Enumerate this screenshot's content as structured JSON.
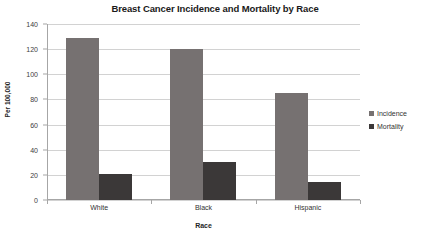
{
  "chart_data": {
    "type": "bar",
    "title": "Breast Cancer Incidence and Mortality by Race",
    "xlabel": "Race",
    "ylabel": "Per 100,000",
    "categories": [
      "White",
      "Black",
      "Hispanic"
    ],
    "series": [
      {
        "name": "Incidence",
        "color": "#767171",
        "values": [
          129,
          120,
          85
        ]
      },
      {
        "name": "Mortality",
        "color": "#3b3838",
        "values": [
          21,
          30,
          14
        ]
      }
    ],
    "ylim": [
      0,
      140
    ],
    "yticks": [
      0,
      20,
      40,
      60,
      80,
      100,
      120,
      140
    ],
    "ytick_labels": [
      "0",
      "20",
      "40",
      "60",
      "80",
      "100",
      "120",
      "140"
    ],
    "grid": true,
    "legend_position": "right"
  }
}
